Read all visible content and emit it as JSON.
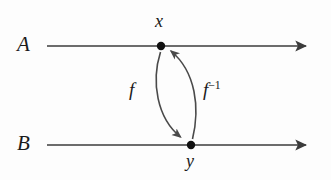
{
  "figure": {
    "type": "diagram",
    "background_color": "#fdfdfd",
    "stroke_color": "#3b3b3b",
    "text_color": "#1a1a1a"
  },
  "lines": [
    {
      "name": "line-A",
      "label": "A",
      "label_x": 17,
      "label_y": 34,
      "x1": 47,
      "x2": 312,
      "y": 46,
      "arrow": "right"
    },
    {
      "name": "line-B",
      "label": "B",
      "label_x": 17,
      "label_y": 133,
      "x1": 47,
      "x2": 312,
      "y": 145,
      "arrow": "right"
    }
  ],
  "points": [
    {
      "name": "point-x",
      "label": "x",
      "cx": 161,
      "cy": 46,
      "r": 4.2,
      "label_position": "above"
    },
    {
      "name": "point-y",
      "label": "y",
      "cx": 191,
      "cy": 145,
      "r": 4.2,
      "label_position": "below"
    }
  ],
  "maps": [
    {
      "name": "map-f",
      "label": "f",
      "label_sup": "",
      "from": "x",
      "to": "y",
      "direction": "down",
      "label_x": 129,
      "label_y": 80
    },
    {
      "name": "map-f-inverse",
      "label": "f",
      "label_sup": "−1",
      "from": "y",
      "to": "x",
      "direction": "up",
      "label_x": 203,
      "label_y": 80
    }
  ]
}
